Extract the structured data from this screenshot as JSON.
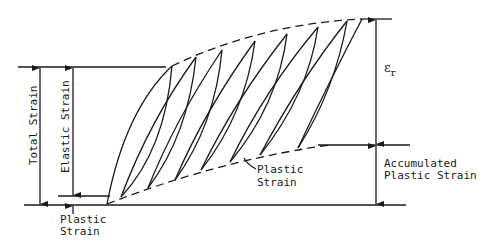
{
  "diagram": {
    "type": "ratcheting strain diagram",
    "labels": {
      "total_strain": "Total Strain",
      "elastic_strain": "Elastic Strain",
      "plastic_strain_bottom_line1": "Plastic",
      "plastic_strain_bottom_line2": "Strain",
      "plastic_strain_curve_line1": "Plastic",
      "plastic_strain_curve_line2": "Strain",
      "epsilon_symbol": "ε",
      "epsilon_subscript": "r",
      "accumulated_line1": "Accumulated",
      "accumulated_line2": "Plastic Strain"
    },
    "colors": {
      "ink": "#1a1a1a",
      "background": "#ffffff"
    }
  }
}
